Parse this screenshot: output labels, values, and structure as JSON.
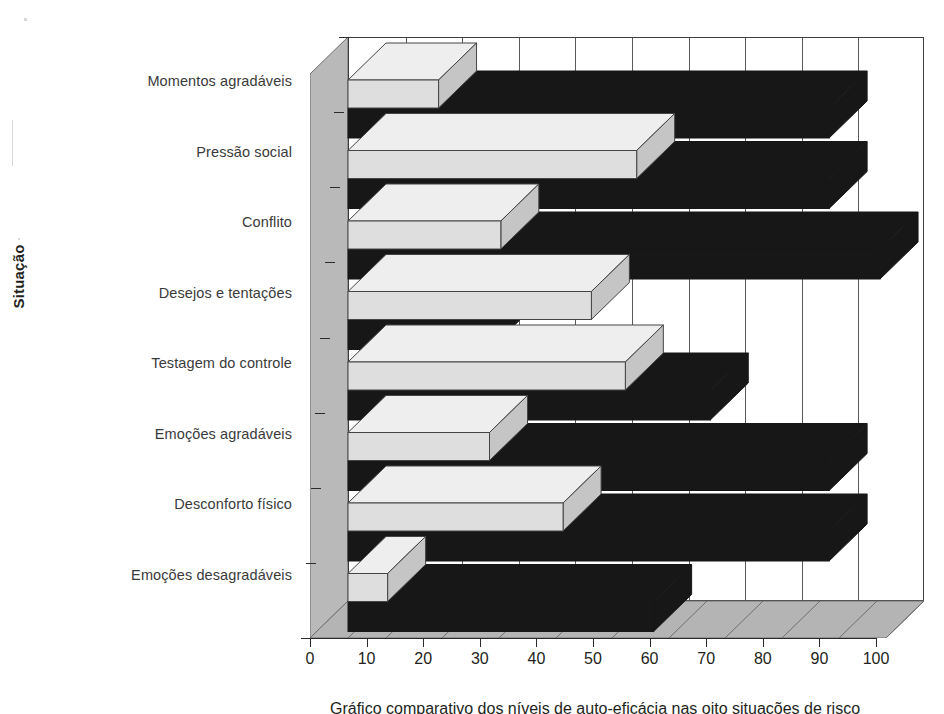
{
  "chart_data": {
    "type": "bar",
    "orientation": "horizontal",
    "title": "",
    "xlabel": "",
    "ylabel": "Situação",
    "xlim": [
      0,
      100
    ],
    "xticks": [
      0,
      10,
      20,
      30,
      40,
      50,
      60,
      70,
      80,
      90,
      100
    ],
    "grid": true,
    "legend": "none",
    "style": "3d-horizontal-bar",
    "categories": [
      "Momentos agradáveis",
      "Pressão social",
      "Conflito",
      "Desejos e tentações",
      "Testagem do controle",
      "Emoções agradáveis",
      "Desconforto físico",
      "Emoções desagradáveis"
    ],
    "series": [
      {
        "name": "Série clara",
        "color": "#dcdcdc",
        "values": [
          16,
          51,
          27,
          43,
          49,
          25,
          38,
          7
        ]
      },
      {
        "name": "Série escura",
        "color": "#1a1a1a",
        "values": [
          85,
          85,
          94,
          25,
          64,
          85,
          85,
          54
        ]
      }
    ]
  },
  "axis": {
    "y_title": "Situação",
    "x_tick_labels": [
      "0",
      "10",
      "20",
      "30",
      "40",
      "50",
      "60",
      "70",
      "80",
      "90",
      "100"
    ]
  },
  "caption": {
    "text": "Gráfico comparativo dos níveis de auto-eficácia nas oito situações de risco"
  }
}
